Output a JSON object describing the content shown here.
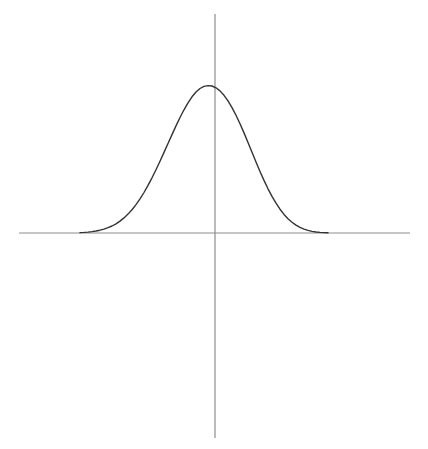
{
  "figure": {
    "title": "",
    "background_color": "#ffffff",
    "width": 428,
    "height": 449,
    "axis_color": "#8d8d8d",
    "axis_width": 1.2,
    "curve_color": "#333333",
    "curve_width": 1.4
  },
  "axes": {
    "origin_x": 215,
    "origin_y": 233,
    "x_axis": {
      "label": "",
      "start_px": 19,
      "end_px": 410,
      "y_px": 233,
      "ticks": [],
      "tick_labels": []
    },
    "y_axis": {
      "label": "",
      "start_px": 14,
      "end_px": 438,
      "x_px": 215,
      "ticks": [],
      "tick_labels": []
    },
    "grid": false
  },
  "chart_data": {
    "type": "line",
    "title": "",
    "subtitle": "",
    "xlabel": "",
    "ylabel": "",
    "legend": [],
    "legend_position": "none",
    "grid": false,
    "annotations": [],
    "xlim": [
      -3.5,
      3.5
    ],
    "ylim": [
      0,
      1.05
    ],
    "xticks": [],
    "yticks": [],
    "xticklabels": [],
    "yticklabels": [],
    "series": [
      {
        "name": "gaussian",
        "function": "y = exp(-x^2 / 2)",
        "mean": 0,
        "sigma": 1,
        "amplitude": 1,
        "peak_px": [
          212,
          86
        ],
        "x": [
          -3.5,
          -3.2,
          -3.0,
          -2.8,
          -2.6,
          -2.4,
          -2.2,
          -2.0,
          -1.8,
          -1.6,
          -1.4,
          -1.2,
          -1.0,
          -0.8,
          -0.6,
          -0.4,
          -0.2,
          0.0,
          0.2,
          0.4,
          0.6,
          0.8,
          1.0,
          1.2,
          1.4,
          1.6,
          1.8,
          2.0,
          2.2,
          2.4,
          2.6,
          2.8,
          3.0,
          3.2,
          3.5
        ],
        "y": [
          0.002,
          0.006,
          0.011,
          0.02,
          0.034,
          0.056,
          0.089,
          0.135,
          0.198,
          0.278,
          0.375,
          0.487,
          0.607,
          0.726,
          0.835,
          0.923,
          0.98,
          1.0,
          0.98,
          0.923,
          0.835,
          0.726,
          0.607,
          0.487,
          0.375,
          0.278,
          0.198,
          0.135,
          0.089,
          0.056,
          0.034,
          0.02,
          0.011,
          0.006,
          0.002
        ]
      }
    ]
  },
  "geometry": {
    "curve_path": "M 80 232.6 L 84 232.4 L 88 232.1 L 92 231.6 L 96 231.0 L 100 230.2 L 104 229.1 L 108 227.7 L 112 226.0 L 116 223.8 L 120 221.1 L 124 217.9 L 128 214.1 L 132 209.7 L 136 204.6 L 140 198.9 L 144 192.5 L 148 185.4 L 152 177.8 L 156 169.7 L 160 161.2 L 164 152.4 L 168 143.5 L 172 134.6 L 176 125.9 L 180 117.5 L 184 109.8 L 188 102.8 L 192 96.8 L 196 92.0 L 200 88.5 L 204 86.4 L 208 85.6 L 212 86.0 L 216 87.8 L 220 90.9 L 224 95.3 L 228 100.9 L 232 107.6 L 236 115.3 L 240 123.8 L 244 132.9 L 248 142.5 L 252 152.3 L 256 162.0 L 260 171.4 L 264 180.4 L 268 188.8 L 272 196.4 L 276 203.2 L 280 209.2 L 284 214.4 L 288 218.7 L 292 222.2 L 296 225.1 L 300 227.4 L 304 229.1 L 308 230.4 L 312 231.4 L 316 232.0 L 320 232.4 L 324 232.6 L 328 232.7",
    "left_tail_meets_axis_px": 80,
    "right_tail_meets_axis_px": 328
  }
}
